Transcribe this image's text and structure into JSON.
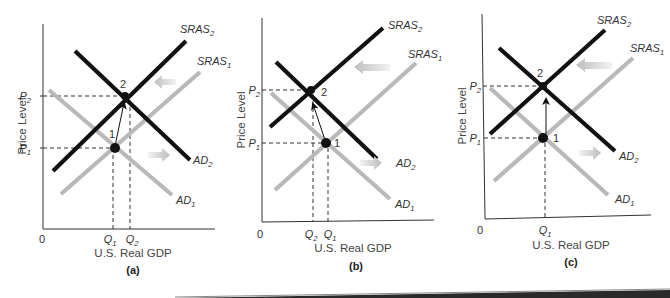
{
  "figure": {
    "panels": [
      {
        "id": "a",
        "caption": "(a)",
        "y_axis_label": "Price Level",
        "x_axis_label": "U.S. Real GDP",
        "origin_label": "0",
        "y_ticks": [
          {
            "base": "P",
            "sub": "2"
          },
          {
            "base": "P",
            "sub": "1"
          }
        ],
        "x_ticks": [
          {
            "base": "Q",
            "sub": "1"
          },
          {
            "base": "Q",
            "sub": "2"
          }
        ],
        "curves": {
          "sras2": {
            "base": "SRAS",
            "sub": "2"
          },
          "sras1": {
            "base": "SRAS",
            "sub": "1"
          },
          "ad2": {
            "base": "AD",
            "sub": "2"
          },
          "ad1": {
            "base": "AD",
            "sub": "1"
          }
        },
        "points": {
          "p1": "1",
          "p2": "2"
        }
      },
      {
        "id": "b",
        "caption": "(b)",
        "y_axis_label": "Price Level",
        "x_axis_label": "U.S. Real GDP",
        "origin_label": "0",
        "y_ticks": [
          {
            "base": "P",
            "sub": "2"
          },
          {
            "base": "P",
            "sub": "1"
          }
        ],
        "x_ticks": [
          {
            "base": "Q",
            "sub": "2"
          },
          {
            "base": "Q",
            "sub": "1"
          }
        ],
        "curves": {
          "sras2": {
            "base": "SRAS",
            "sub": "2"
          },
          "sras1": {
            "base": "SRAS",
            "sub": "1"
          },
          "ad2": {
            "base": "AD",
            "sub": "2"
          },
          "ad1": {
            "base": "AD",
            "sub": "1"
          }
        },
        "points": {
          "p1": "1",
          "p2": "2"
        }
      },
      {
        "id": "c",
        "caption": "(c)",
        "y_axis_label": "Price Level",
        "x_axis_label": "U.S. Real GDP",
        "origin_label": "0",
        "y_ticks": [
          {
            "base": "P",
            "sub": "2"
          },
          {
            "base": "P",
            "sub": "1"
          }
        ],
        "x_ticks": [
          {
            "base": "Q",
            "sub": "1"
          }
        ],
        "curves": {
          "sras2": {
            "base": "SRAS",
            "sub": "2"
          },
          "sras1": {
            "base": "SRAS",
            "sub": "1"
          },
          "ad2": {
            "base": "AD",
            "sub": "2"
          },
          "ad1": {
            "base": "AD",
            "sub": "1"
          }
        },
        "points": {
          "p1": "1",
          "p2": "2"
        }
      }
    ],
    "colors": {
      "shifted_curve": "#111111",
      "original_curve": "#b9b9b9",
      "shift_arrow": "#c8c8c8"
    }
  }
}
